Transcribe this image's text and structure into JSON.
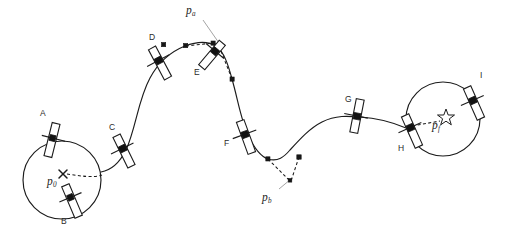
{
  "figure": {
    "background_color": "#ffffff",
    "stroke_color": "#1b1b1b",
    "leader_color": "#9a9a9a",
    "width": 514,
    "height": 239
  },
  "waypoint_labels": [
    {
      "id": "A",
      "text": "A",
      "x": 40,
      "y": 112
    },
    {
      "id": "B",
      "text": "B",
      "x": 60,
      "y": 218
    },
    {
      "id": "C",
      "text": "C",
      "x": 109,
      "y": 126
    },
    {
      "id": "D",
      "text": "D",
      "x": 149,
      "y": 36
    },
    {
      "id": "E",
      "text": "E",
      "x": 194,
      "y": 71
    },
    {
      "id": "F",
      "text": "F",
      "x": 223,
      "y": 143
    },
    {
      "id": "G",
      "text": "G",
      "x": 344,
      "y": 98
    },
    {
      "id": "H",
      "text": "H",
      "x": 397,
      "y": 147
    },
    {
      "id": "I",
      "text": "I",
      "x": 479,
      "y": 73
    }
  ],
  "point_labels": [
    {
      "id": "p0",
      "base": "p",
      "sub": "0",
      "x": 47,
      "y": 180,
      "marker": "x-marker"
    },
    {
      "id": "pa",
      "base": "p",
      "sub": "a",
      "x": 186,
      "y": 6,
      "marker": "leader-endpoint"
    },
    {
      "id": "pb",
      "base": "p",
      "sub": "b",
      "x": 262,
      "y": 192,
      "marker": "leader-endpoint"
    },
    {
      "id": "pf",
      "base": "p",
      "sub": "f",
      "x": 431,
      "y": 117,
      "marker": "star-marker"
    }
  ],
  "markers": {
    "start_marker": {
      "name": "x-marker",
      "x": 63,
      "y": 174
    },
    "goal_marker": {
      "name": "star-marker",
      "x": 446,
      "y": 114
    }
  },
  "circles": [
    {
      "id": "start-circle",
      "cx": 62,
      "cy": 180,
      "r": 39
    },
    {
      "id": "goal-circle",
      "cx": 443,
      "cy": 119,
      "r": 37
    }
  ],
  "control_points": [
    {
      "x": 185,
      "y": 46
    },
    {
      "x": 213,
      "y": 43
    },
    {
      "x": 232,
      "y": 79
    },
    {
      "x": 268,
      "y": 159
    },
    {
      "x": 299,
      "y": 157
    },
    {
      "x": 290,
      "y": 182
    }
  ],
  "robots": [
    {
      "id": "robot-A",
      "x": 52,
      "y": 140,
      "angle": 15
    },
    {
      "id": "robot-B",
      "x": 72,
      "y": 200,
      "angle": -22
    },
    {
      "id": "robot-C",
      "x": 122,
      "y": 150,
      "angle": -28
    },
    {
      "id": "robot-D",
      "x": 158,
      "y": 62,
      "angle": -28
    },
    {
      "id": "robot-E",
      "x": 212,
      "y": 54,
      "angle": 40
    },
    {
      "id": "robot-F",
      "x": 245,
      "y": 136,
      "angle": -20
    },
    {
      "id": "robot-G",
      "x": 356,
      "y": 116,
      "angle": 12
    },
    {
      "id": "robot-H",
      "x": 410,
      "y": 131,
      "angle": -22
    },
    {
      "id": "robot-I",
      "x": 473,
      "y": 102,
      "angle": -22
    }
  ],
  "paths": {
    "main_trajectory": "M 101 172 C 112 170 120 162 126 150 C 136 128 138 100 150 78 C 158 63 170 52 185 46 C 198 41 208 41 216 46 C 224 52 228 64 232 79 C 238 100 241 120 248 135 C 256 152 262 157 268 159 C 278 162 284 157 290 150 C 300 139 310 128 322 122 C 336 115 348 116 360 117 C 376 118 392 122 406 128",
    "arc_start_to_A": "M 47 146 C 58 138 74 136 86 140 C 95 143 99 150 101 158",
    "arc_A_to_B": "M 47 146 C 36 156 30 172 33 188 C 37 205 54 216 70 216",
    "arc_B_to_C": "M 70 216 C 84 215 96 206 100 194 C 102 186 102 178 101 172",
    "goal_arc_top": "M 419 137 C 412 124 414 104 424 92 C 436 78 456 76 468 85",
    "goal_arc_right": "M 468 85 C 478 95 480 113 474 126 C 466 142 446 151 430 147 C 424 145 420 141 419 137",
    "dashed_start_radius": "M 66 174 C 80 176 94 178 104 176",
    "dashed_goal_radius": "M 406 128 L 441 122",
    "dashed_pa_left": "M 185 46 L 215 42",
    "dashed_pa_down": "M 216 46 L 232 79",
    "dashed_pb_left": "M 268 159 L 290 180",
    "dashed_pb_right": "M 299 157 L 291 181",
    "leader_pa": "M 205 22 L 219 44",
    "leader_pb": "M 280 188 L 291 178"
  }
}
